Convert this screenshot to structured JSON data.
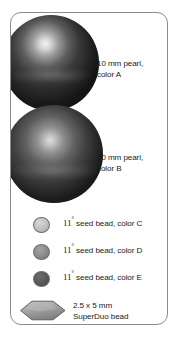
{
  "panel": {
    "border_color": "#8c8c8c",
    "background": "#ffffff"
  },
  "legend": {
    "title": "Bead materials key",
    "items": [
      {
        "id": "pearl-a",
        "swatch": "sphere",
        "swatch_name": "large-pearl-swatch",
        "color": "#2b2b2b",
        "size": "10 mm",
        "type": "pearl",
        "color_code": "color A",
        "line1": "10 mm pearl,",
        "line2": "color A"
      },
      {
        "id": "pearl-b",
        "swatch": "sphere",
        "swatch_name": "large-pearl-swatch",
        "color": "#353535",
        "size": "10 mm",
        "type": "pearl",
        "color_code": "color B",
        "line1": "10 mm pearl,",
        "line2": "color B"
      },
      {
        "id": "seed-c",
        "swatch": "circle",
        "swatch_name": "seed-bead-swatch",
        "color": "#c5c5c5",
        "size_num": "11",
        "size_sup": "°",
        "rest": " seed bead, color C",
        "type": "seed bead",
        "color_code": "color C"
      },
      {
        "id": "seed-d",
        "swatch": "circle",
        "swatch_name": "seed-bead-swatch",
        "color": "#8f8f8f",
        "size_num": "11",
        "size_sup": "°",
        "rest": " seed bead, color D",
        "type": "seed bead",
        "color_code": "color D"
      },
      {
        "id": "seed-e",
        "swatch": "circle",
        "swatch_name": "seed-bead-swatch",
        "color": "#5c5c5c",
        "size_num": "11",
        "size_sup": "°",
        "rest": " seed bead, color E",
        "type": "seed bead",
        "color_code": "color E"
      },
      {
        "id": "superduo",
        "swatch": "lozenge",
        "swatch_name": "superduo-bead-swatch",
        "color": "#9a9a9a",
        "size": "2.5 x 5 mm",
        "type": "SuperDuo bead",
        "line1": "2.5 x 5 mm",
        "line2": "SuperDuo bead"
      }
    ]
  }
}
